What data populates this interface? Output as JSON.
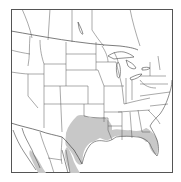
{
  "map": {
    "type": "species-range-map",
    "region": "North America (USA, southern Canada, northern Mexico)",
    "range_color": "#c8c8c8",
    "border_color": "#555555",
    "background_color": "#ffffff",
    "shaded_range_regions": [
      "Texas (central and east)",
      "Oklahoma (south edge)",
      "Arkansas (south)",
      "Louisiana",
      "Mississippi (south)",
      "Alabama (south)",
      "Georgia (south)",
      "Florida",
      "Northeastern Mexico (Tamaulipas, Nuevo León)",
      "Western Mexico (Sonora/Sinaloa coast)"
    ]
  }
}
